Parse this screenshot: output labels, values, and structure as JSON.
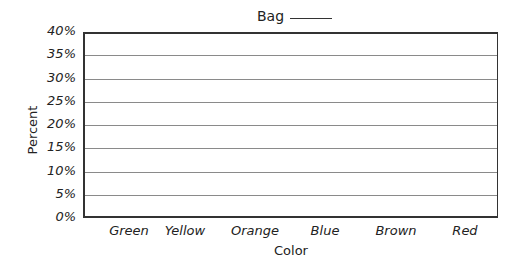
{
  "chart_data": {
    "type": "bar",
    "title_text": "Bag",
    "xlabel": "Color",
    "ylabel": "Percent",
    "categories": [
      "Green",
      "Yellow",
      "Orange",
      "Blue",
      "Brown",
      "Red"
    ],
    "values": [
      null,
      null,
      null,
      null,
      null,
      null
    ],
    "yticks": [
      "0%",
      "5%",
      "10%",
      "15%",
      "20%",
      "25%",
      "30%",
      "35%",
      "40%"
    ],
    "ylim": [
      0,
      40
    ],
    "grid": true,
    "legend": null
  }
}
